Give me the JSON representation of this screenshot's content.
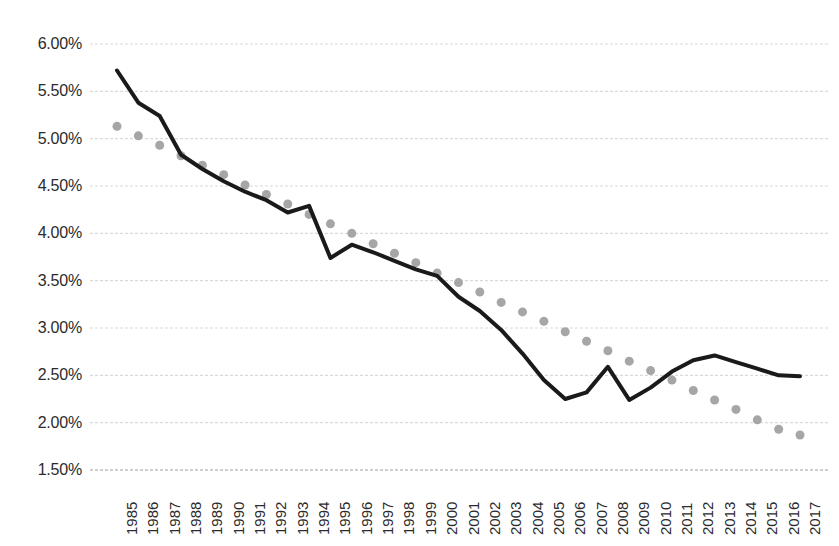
{
  "chart_data": {
    "type": "line",
    "title": "",
    "subtitle": "",
    "xlabel": "",
    "ylabel": "",
    "ylim": [
      1.5,
      6.0
    ],
    "ytick_step": 0.5,
    "ytick_labels": [
      "6.00%",
      "5.50%",
      "5.00%",
      "4.50%",
      "4.00%",
      "3.50%",
      "3.00%",
      "2.50%",
      "2.00%",
      "1.50%"
    ],
    "ytick_values": [
      6.0,
      5.5,
      5.0,
      4.5,
      4.0,
      3.5,
      3.0,
      2.5,
      2.0,
      1.5
    ],
    "grid": true,
    "grid_color": "#d9d9d9",
    "legend": "none",
    "legend_position": "none",
    "categories": [
      "1985",
      "1986",
      "1987",
      "1988",
      "1989",
      "1990",
      "1991",
      "1992",
      "1993",
      "1994",
      "1995",
      "1996",
      "1997",
      "1998",
      "1999",
      "2000",
      "2001",
      "2002",
      "2003",
      "2004",
      "2005",
      "2006",
      "2007",
      "2008",
      "2009",
      "2010",
      "2011",
      "2012",
      "2013",
      "2014",
      "2015",
      "2016",
      "2017"
    ],
    "series": [
      {
        "name": "Series 1",
        "style": "solid-line",
        "color": "#1a1a1a",
        "line_width": 4,
        "values": [
          5.72,
          5.38,
          5.24,
          4.83,
          4.68,
          4.55,
          4.44,
          4.35,
          4.22,
          4.29,
          3.74,
          3.88,
          3.8,
          3.71,
          3.62,
          3.55,
          3.33,
          3.18,
          2.98,
          2.73,
          2.45,
          2.25,
          2.32,
          2.59,
          2.24,
          2.37,
          2.54,
          2.66,
          2.71,
          2.64,
          2.57,
          2.5,
          2.49
        ]
      },
      {
        "name": "Trendline",
        "style": "dotted",
        "color": "#a6a6a6",
        "marker_size": 9,
        "values": [
          5.13,
          5.03,
          4.93,
          4.82,
          4.72,
          4.62,
          4.51,
          4.41,
          4.31,
          4.2,
          4.1,
          4.0,
          3.89,
          3.79,
          3.69,
          3.58,
          3.48,
          3.38,
          3.27,
          3.17,
          3.07,
          2.96,
          2.86,
          2.76,
          2.65,
          2.55,
          2.45,
          2.34,
          2.24,
          2.14,
          2.03,
          1.93,
          1.87
        ]
      }
    ]
  },
  "axis": {
    "baseline_color": "#bfbfbf"
  }
}
